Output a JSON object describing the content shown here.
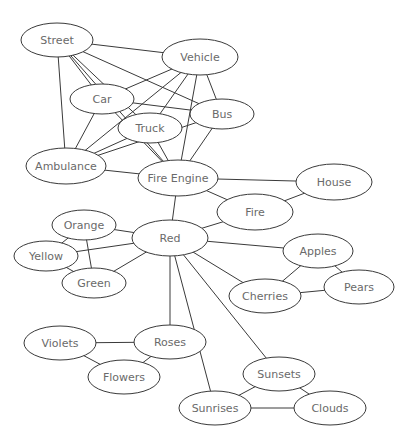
{
  "diagram": {
    "type": "semantic-network",
    "nodes": [
      {
        "id": "street",
        "label": "Street",
        "x": 57,
        "y": 40,
        "rx": 36,
        "ry": 17
      },
      {
        "id": "vehicle",
        "label": "Vehicle",
        "x": 200,
        "y": 57,
        "rx": 38,
        "ry": 18
      },
      {
        "id": "car",
        "label": "Car",
        "x": 102,
        "y": 99,
        "rx": 32,
        "ry": 15
      },
      {
        "id": "bus",
        "label": "Bus",
        "x": 222,
        "y": 114,
        "rx": 32,
        "ry": 15
      },
      {
        "id": "truck",
        "label": "Truck",
        "x": 150,
        "y": 128,
        "rx": 32,
        "ry": 15
      },
      {
        "id": "ambulance",
        "label": "Ambulance",
        "x": 66,
        "y": 166,
        "rx": 40,
        "ry": 18
      },
      {
        "id": "fire_engine",
        "label": "Fire Engine",
        "x": 178,
        "y": 178,
        "rx": 40,
        "ry": 18
      },
      {
        "id": "house",
        "label": "House",
        "x": 334,
        "y": 182,
        "rx": 38,
        "ry": 18
      },
      {
        "id": "fire",
        "label": "Fire",
        "x": 255,
        "y": 212,
        "rx": 38,
        "ry": 18
      },
      {
        "id": "orange",
        "label": "Orange",
        "x": 84,
        "y": 225,
        "rx": 32,
        "ry": 15
      },
      {
        "id": "red",
        "label": "Red",
        "x": 170,
        "y": 238,
        "rx": 38,
        "ry": 18
      },
      {
        "id": "yellow",
        "label": "Yellow",
        "x": 46,
        "y": 256,
        "rx": 32,
        "ry": 15
      },
      {
        "id": "green",
        "label": "Green",
        "x": 94,
        "y": 283,
        "rx": 32,
        "ry": 15
      },
      {
        "id": "apples",
        "label": "Apples",
        "x": 318,
        "y": 251,
        "rx": 35,
        "ry": 17
      },
      {
        "id": "pears",
        "label": "Pears",
        "x": 359,
        "y": 287,
        "rx": 35,
        "ry": 17
      },
      {
        "id": "cherries",
        "label": "Cherries",
        "x": 265,
        "y": 296,
        "rx": 36,
        "ry": 17
      },
      {
        "id": "violets",
        "label": "Violets",
        "x": 60,
        "y": 343,
        "rx": 36,
        "ry": 17
      },
      {
        "id": "roses",
        "label": "Roses",
        "x": 170,
        "y": 342,
        "rx": 36,
        "ry": 17
      },
      {
        "id": "flowers",
        "label": "Flowers",
        "x": 124,
        "y": 377,
        "rx": 36,
        "ry": 17
      },
      {
        "id": "sunsets",
        "label": "Sunsets",
        "x": 279,
        "y": 374,
        "rx": 36,
        "ry": 17
      },
      {
        "id": "sunrises",
        "label": "Sunrises",
        "x": 215,
        "y": 408,
        "rx": 36,
        "ry": 17
      },
      {
        "id": "clouds",
        "label": "Clouds",
        "x": 330,
        "y": 408,
        "rx": 36,
        "ry": 17
      }
    ],
    "edges": [
      [
        "street",
        "vehicle"
      ],
      [
        "street",
        "car"
      ],
      [
        "street",
        "truck"
      ],
      [
        "street",
        "bus"
      ],
      [
        "street",
        "ambulance"
      ],
      [
        "street",
        "fire_engine"
      ],
      [
        "vehicle",
        "car"
      ],
      [
        "vehicle",
        "truck"
      ],
      [
        "vehicle",
        "bus"
      ],
      [
        "vehicle",
        "ambulance"
      ],
      [
        "vehicle",
        "fire_engine"
      ],
      [
        "car",
        "bus"
      ],
      [
        "car",
        "ambulance"
      ],
      [
        "car",
        "fire_engine"
      ],
      [
        "truck",
        "ambulance"
      ],
      [
        "truck",
        "fire_engine"
      ],
      [
        "bus",
        "ambulance"
      ],
      [
        "bus",
        "fire_engine"
      ],
      [
        "ambulance",
        "fire_engine"
      ],
      [
        "fire_engine",
        "house"
      ],
      [
        "fire_engine",
        "fire"
      ],
      [
        "fire_engine",
        "red"
      ],
      [
        "house",
        "fire"
      ],
      [
        "fire",
        "red"
      ],
      [
        "red",
        "orange"
      ],
      [
        "red",
        "yellow"
      ],
      [
        "red",
        "green"
      ],
      [
        "orange",
        "yellow"
      ],
      [
        "orange",
        "green"
      ],
      [
        "yellow",
        "green"
      ],
      [
        "red",
        "apples"
      ],
      [
        "red",
        "cherries"
      ],
      [
        "red",
        "roses"
      ],
      [
        "red",
        "sunsets"
      ],
      [
        "red",
        "sunrises"
      ],
      [
        "apples",
        "cherries"
      ],
      [
        "apples",
        "pears"
      ],
      [
        "cherries",
        "pears"
      ],
      [
        "violets",
        "roses"
      ],
      [
        "violets",
        "flowers"
      ],
      [
        "roses",
        "flowers"
      ],
      [
        "sunsets",
        "sunrises"
      ],
      [
        "sunsets",
        "clouds"
      ],
      [
        "sunrises",
        "clouds"
      ]
    ]
  }
}
